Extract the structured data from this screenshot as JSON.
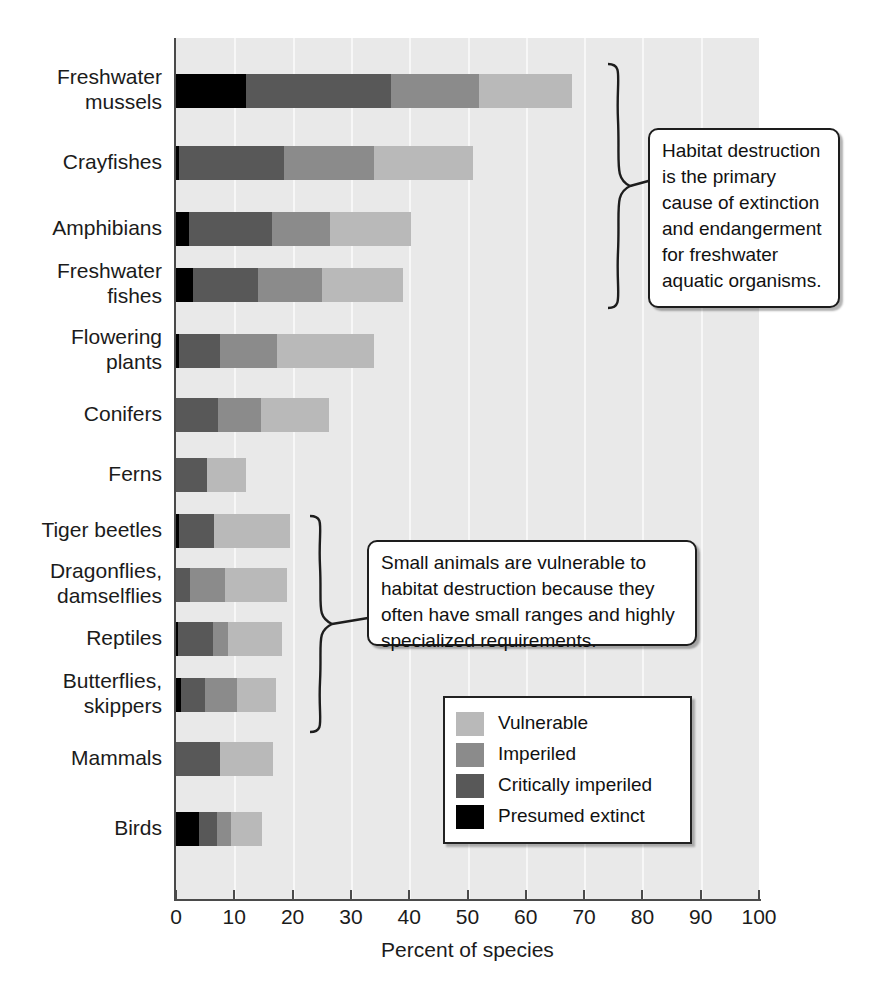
{
  "chart_data": {
    "type": "bar",
    "orientation": "horizontal",
    "stacked": true,
    "title": "",
    "xlabel": "Percent of species",
    "ylabel": "",
    "xlim": [
      0,
      100
    ],
    "xticks": [
      0,
      10,
      20,
      30,
      40,
      50,
      60,
      70,
      80,
      90,
      100
    ],
    "grid": "vertical",
    "legend_position": "inside-bottom-right",
    "categories": [
      "Freshwater mussels",
      "Crayfishes",
      "Amphibians",
      "Freshwater fishes",
      "Flowering plants",
      "Conifers",
      "Ferns",
      "Tiger beetles",
      "Dragonflies, damselflies",
      "Reptiles",
      "Butterflies, skippers",
      "Mammals",
      "Birds"
    ],
    "series": [
      {
        "name": "Presumed extinct",
        "color": "#000000",
        "values": [
          12.0,
          0.6,
          2.2,
          3.0,
          0.5,
          0.0,
          0.0,
          0.5,
          0.0,
          0.3,
          0.8,
          0.0,
          4.0
        ]
      },
      {
        "name": "Critically imperiled",
        "color": "#585858",
        "values": [
          24.9,
          17.9,
          14.2,
          11.0,
          7.0,
          7.2,
          5.3,
          6.0,
          2.4,
          6.0,
          4.2,
          7.5,
          3.0
        ]
      },
      {
        "name": "Imperiled",
        "color": "#8b8b8b",
        "values": [
          15.1,
          15.5,
          10.0,
          11.0,
          9.8,
          7.4,
          0.0,
          0.0,
          6.0,
          2.7,
          5.4,
          0.0,
          2.5
        ]
      },
      {
        "name": "Vulnerable",
        "color": "#b9b9b9",
        "values": [
          16.0,
          17.0,
          13.9,
          14.0,
          16.7,
          11.6,
          6.7,
          13.1,
          10.6,
          9.2,
          6.8,
          9.2,
          5.2
        ]
      }
    ],
    "totals": [
      68.0,
      51.0,
      40.3,
      39.0,
      34.0,
      26.2,
      12.0,
      19.6,
      19.0,
      18.2,
      17.2,
      16.7,
      14.7
    ]
  },
  "axis": {
    "x_title": "Percent of species",
    "tick_labels": [
      "0",
      "10",
      "20",
      "30",
      "40",
      "50",
      "60",
      "70",
      "80",
      "90",
      "100"
    ]
  },
  "category_labels": [
    {
      "lines": [
        "Freshwater",
        "mussels"
      ]
    },
    {
      "lines": [
        "Crayfishes"
      ]
    },
    {
      "lines": [
        "Amphibians"
      ]
    },
    {
      "lines": [
        "Freshwater",
        "fishes"
      ]
    },
    {
      "lines": [
        "Flowering",
        "plants"
      ]
    },
    {
      "lines": [
        "Conifers"
      ]
    },
    {
      "lines": [
        "Ferns"
      ]
    },
    {
      "lines": [
        "Tiger beetles"
      ]
    },
    {
      "lines": [
        "Dragonflies,",
        "damselflies"
      ]
    },
    {
      "lines": [
        "Reptiles"
      ]
    },
    {
      "lines": [
        "Butterflies,",
        "skippers"
      ]
    },
    {
      "lines": [
        "Mammals"
      ]
    },
    {
      "lines": [
        "Birds"
      ]
    }
  ],
  "legend": {
    "items": [
      {
        "label": "Vulnerable",
        "color": "#b9b9b9"
      },
      {
        "label": "Imperiled",
        "color": "#8b8b8b"
      },
      {
        "label": "Critically imperiled",
        "color": "#585858"
      },
      {
        "label": "Presumed extinct",
        "color": "#000000"
      }
    ]
  },
  "callouts": [
    {
      "id": "habitat",
      "text": "Habitat destruction is the primary cause of extinction and endangerment for freshwater aquatic organisms."
    },
    {
      "id": "small-animals",
      "text": "Small animals are vulnerable to habitat destruction because they often have small ranges and highly specialized requirements."
    }
  ],
  "colors": {
    "plot_background": "#e9e9e9",
    "gridline": "#f7f7f7",
    "axis": "#4a4a4a",
    "text": "#1b1b1b"
  }
}
